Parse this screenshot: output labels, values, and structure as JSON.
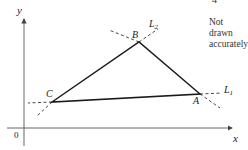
{
  "question_number": "4",
  "note": {
    "line1": "Not drawn",
    "line2": "accurately"
  },
  "axes": {
    "x_label": "x",
    "y_label": "y",
    "origin_label": "0"
  },
  "points": {
    "A": {
      "label": "A"
    },
    "B": {
      "label": "B"
    },
    "C": {
      "label": "C"
    }
  },
  "lines": {
    "L1": {
      "name": "L",
      "sub": "1"
    },
    "L2": {
      "name": "L",
      "sub": "2"
    }
  },
  "colors": {
    "axis": "#555555",
    "triangle": "#1a1a1a",
    "dashed": "#333333",
    "text": "#222222"
  }
}
